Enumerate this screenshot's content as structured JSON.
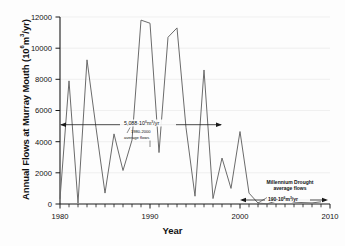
{
  "chart_data": {
    "type": "line",
    "title": "",
    "xlabel": "Year",
    "ylabel": "Annual Flows at Murray Mouth (10⁶m³/yr)",
    "xlim": [
      1980,
      2010
    ],
    "ylim": [
      0,
      12000
    ],
    "xticks_major": [
      1980,
      1990,
      2000,
      2010
    ],
    "xticks_major_labels": [
      "1980",
      "1990",
      "2000",
      "2010"
    ],
    "xtick_minor_step": 1,
    "yticks": [
      0,
      2000,
      4000,
      6000,
      8000,
      10000,
      12000
    ],
    "ytick_labels": [
      "0",
      "2000",
      "4000",
      "6000",
      "8000",
      "10000",
      "12000"
    ],
    "grid": "horizontal",
    "legend": "none",
    "line_color": "#6b6b6b",
    "axis_color": "#1a1a1a",
    "grid_color": "#e6e6e6",
    "series": [
      {
        "name": "Annual flows at Murray Mouth",
        "x": [
          1980,
          1981,
          1982,
          1983,
          1984,
          1985,
          1986,
          1987,
          1988,
          1989,
          1990,
          1991,
          1992,
          1993,
          1994,
          1995,
          1996,
          1997,
          1998,
          1999,
          2000,
          2001,
          2002,
          2003,
          2004,
          2005,
          2006,
          2007,
          2008,
          2009
        ],
        "values": [
          330,
          7900,
          60,
          9250,
          4900,
          700,
          4500,
          2150,
          4100,
          11800,
          11600,
          3300,
          10700,
          11300,
          4900,
          500,
          8600,
          350,
          2950,
          1000,
          4650,
          700,
          60,
          10,
          180,
          260,
          120,
          90,
          70,
          140
        ]
      }
    ],
    "annotations": [
      {
        "id": "pre-drought-average",
        "value": 5088,
        "line1": "5,088·10⁶m³/yr",
        "line2": "1980-2000",
        "line3": "average flows",
        "span_start": 1980,
        "span_end": 2000,
        "arrow": "double"
      },
      {
        "id": "millennium-drought-average",
        "value": 190,
        "line1": "Millennium Drought",
        "line2": "average flows",
        "line3": "190·10⁶m³/yr",
        "span_start": 2002,
        "span_end": 2009.4,
        "arrow": "double"
      }
    ]
  },
  "axis": {
    "y_label": "Annual Flows at Murray Mouth (10⁶m³/yr)",
    "y_label_prefix": "Annual Flows at Murray Mouth (10",
    "y_label_exp": "6",
    "y_label_suffix": "m",
    "y_label_exp2": "3",
    "y_label_tail": "/yr)",
    "x_label": "Year"
  },
  "ytick_labels": {
    "t0": "0",
    "t1": "2000",
    "t2": "4000",
    "t3": "6000",
    "t4": "8000",
    "t5": "10000",
    "t6": "12000"
  },
  "xtick_labels": {
    "t0": "1980",
    "t1": "1990",
    "t2": "2000",
    "t3": "2010"
  },
  "annotation_text": {
    "avg_value": "5,088·10",
    "avg_exp": "6",
    "avg_unit": "m",
    "avg_exp2": "3",
    "avg_tail": "/yr",
    "avg_period": "1980-2000",
    "avg_caption": "average flows",
    "drought_title": "Millennium Drought",
    "drought_caption": "average flows",
    "drought_value": "190·10",
    "drought_exp": "6",
    "drought_unit": "m",
    "drought_exp2": "3",
    "drought_tail": "/yr"
  }
}
